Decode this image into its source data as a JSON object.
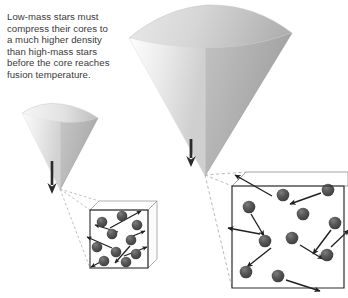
{
  "figure": {
    "kind": "astronomy-textbook-diagram",
    "caption_lines": [
      "Low-mass stars must",
      "compress their cores to",
      "a much higher density",
      "than high-mass stars",
      "before the core reaches",
      "fusion temperature."
    ],
    "caption_text": "Low-mass stars must compress their cores to a much higher density than high-mass stars before the core reaches fusion temperature."
  },
  "colors": {
    "caption_text": "#3a3a3a",
    "funnel_light": "#f2f2f2",
    "funnel_mid": "#dcdcdc",
    "funnel_dark": "#b4b4b4",
    "funnel_darkest": "#9a9a9a",
    "funnel_edge": "#c8c8c8",
    "arrow": "#2b2b2b",
    "box_line": "#2a2a2a",
    "box_line_back": "#8a8a8a",
    "leader_dash": "#b0b0b0",
    "particle_fill": "#585858",
    "particle_dark": "#3c3c3c",
    "particle_highlight": "#8a8a8a",
    "particle_arrow": "#1f1f1f",
    "background": "#ffffff"
  },
  "panels": [
    {
      "id": "low-mass",
      "label": "low-mass star funnel",
      "funnel": {
        "rim_left_x": 22,
        "rim_right_x": 98,
        "rim_y": 112,
        "tip_x": 60,
        "tip_y": 190,
        "width": 76,
        "height": 78,
        "size_class": "small"
      },
      "arrow": {
        "x": 52,
        "y_top": 160,
        "y_bottom": 192,
        "direction": "down"
      },
      "box": {
        "front_x": 90,
        "front_y": 210,
        "front_w": 58,
        "front_h": 58,
        "depth_dx": 9,
        "depth_dy": -9,
        "density": "high",
        "particle_count": 10,
        "particle_radius": 5.2,
        "arrow_length": "short"
      },
      "particles": [
        {
          "cx": 102,
          "cy": 222
        },
        {
          "cx": 122,
          "cy": 216
        },
        {
          "cx": 137,
          "cy": 225
        },
        {
          "cx": 112,
          "cy": 234
        },
        {
          "cx": 131,
          "cy": 240
        },
        {
          "cx": 97,
          "cy": 247
        },
        {
          "cx": 116,
          "cy": 252
        },
        {
          "cx": 136,
          "cy": 254
        },
        {
          "cx": 104,
          "cy": 261
        },
        {
          "cx": 126,
          "cy": 262
        }
      ],
      "motion_arrows": [
        {
          "x1": 110,
          "y1": 228,
          "x2": 140,
          "y2": 212
        },
        {
          "x1": 118,
          "y1": 232,
          "x2": 96,
          "y2": 226
        },
        {
          "x1": 128,
          "y1": 238,
          "x2": 144,
          "y2": 232
        },
        {
          "x1": 112,
          "y1": 248,
          "x2": 88,
          "y2": 238
        },
        {
          "x1": 124,
          "y1": 256,
          "x2": 146,
          "y2": 248
        },
        {
          "x1": 108,
          "y1": 258,
          "x2": 92,
          "y2": 266
        },
        {
          "x1": 130,
          "y1": 246,
          "x2": 116,
          "y2": 262
        }
      ]
    },
    {
      "id": "high-mass",
      "label": "high-mass star funnel",
      "funnel": {
        "rim_left_x": 129,
        "rim_right_x": 292,
        "rim_y": 30,
        "tip_x": 205,
        "tip_y": 176,
        "width": 163,
        "height": 146,
        "size_class": "large"
      },
      "arrow": {
        "x": 191,
        "y_top": 138,
        "y_bottom": 164,
        "direction": "down"
      },
      "box": {
        "front_x": 232,
        "front_y": 186,
        "front_w": 112,
        "front_h": 102,
        "depth_dx": 14,
        "depth_dy": -14,
        "density": "low",
        "particle_count": 11,
        "particle_radius": 6.2,
        "arrow_length": "long"
      },
      "particles": [
        {
          "cx": 249,
          "cy": 207
        },
        {
          "cx": 283,
          "cy": 195
        },
        {
          "cx": 328,
          "cy": 190
        },
        {
          "cx": 315,
          "cy": 229
        },
        {
          "cx": 335,
          "cy": 223
        },
        {
          "cx": 265,
          "cy": 241
        },
        {
          "cx": 292,
          "cy": 238
        },
        {
          "cx": 327,
          "cy": 255
        },
        {
          "cx": 246,
          "cy": 272
        },
        {
          "cx": 278,
          "cy": 276
        },
        {
          "cx": 303,
          "cy": 214
        }
      ],
      "motion_arrows": [
        {
          "x1": 270,
          "y1": 196,
          "x2": 236,
          "y2": 176
        },
        {
          "x1": 322,
          "y1": 193,
          "x2": 288,
          "y2": 205
        },
        {
          "x1": 251,
          "y1": 214,
          "x2": 264,
          "y2": 235
        },
        {
          "x1": 260,
          "y1": 234,
          "x2": 229,
          "y2": 228
        },
        {
          "x1": 331,
          "y1": 229,
          "x2": 312,
          "y2": 253
        },
        {
          "x1": 300,
          "y1": 245,
          "x2": 322,
          "y2": 258
        },
        {
          "x1": 270,
          "y1": 248,
          "x2": 248,
          "y2": 266
        },
        {
          "x1": 330,
          "y1": 248,
          "x2": 348,
          "y2": 232
        },
        {
          "x1": 285,
          "y1": 280,
          "x2": 318,
          "y2": 290
        }
      ]
    }
  ]
}
